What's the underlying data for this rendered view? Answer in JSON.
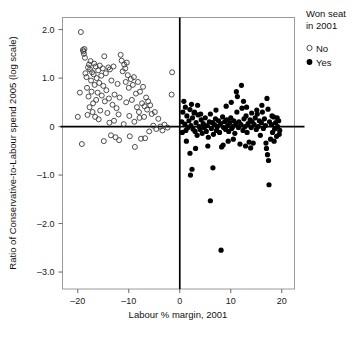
{
  "chart_data": {
    "type": "scatter",
    "title": "",
    "xlabel": "Labour % margin, 2001",
    "ylabel": "Ratio of Conservative-to-Labour spend 2005 (log scale)",
    "xlim": [
      -23,
      22.5
    ],
    "ylim": [
      -3.35,
      2.25
    ],
    "xticks": [
      -20,
      -10,
      0,
      10,
      20
    ],
    "xticklabels": [
      "–20",
      "–10",
      "0",
      "10",
      "20"
    ],
    "yticks": [
      2.0,
      1.0,
      0,
      -1.0,
      -2.0,
      -3.0
    ],
    "yticklabels": [
      "2.0",
      "1.0",
      "0",
      "–1.0",
      "–2.0",
      "–3.0"
    ],
    "grid": false,
    "reference_lines": [
      {
        "orientation": "horizontal",
        "value": 0
      },
      {
        "orientation": "vertical",
        "value": 0
      }
    ],
    "legend": {
      "title": "Won seat\nin 2001",
      "title_line1": "Won seat",
      "title_line2": "in 2001",
      "position": "top-right-outside",
      "entries": [
        {
          "label": "No",
          "marker": "open-circle"
        },
        {
          "label": "Yes",
          "marker": "filled-circle"
        }
      ]
    },
    "series": [
      {
        "name": "No",
        "marker": "open-circle",
        "color": "#3a3a3a",
        "points": [
          [
            -19.4,
            1.95
          ],
          [
            -19.2,
            -0.36
          ],
          [
            -18.9,
            1.55
          ],
          [
            -18.8,
            1.5
          ],
          [
            -18.6,
            1.42
          ],
          [
            -18.5,
            1.1
          ],
          [
            -18.3,
            1.02
          ],
          [
            -18.2,
            0.8
          ],
          [
            -18.0,
            1.22
          ],
          [
            -17.9,
            0.62
          ],
          [
            -17.8,
            1.28
          ],
          [
            -17.6,
            1.18
          ],
          [
            -17.5,
            1.35
          ],
          [
            -17.4,
            0.95
          ],
          [
            -17.3,
            0.72
          ],
          [
            -17.2,
            1.12
          ],
          [
            -17.0,
            0.48
          ],
          [
            -16.9,
            1.08
          ],
          [
            -16.8,
            1.3
          ],
          [
            -16.7,
            0.86
          ],
          [
            -16.5,
            1.24
          ],
          [
            -16.4,
            0.55
          ],
          [
            -16.3,
            1.0
          ],
          [
            -16.1,
            0.7
          ],
          [
            -16.0,
            1.16
          ],
          [
            -15.8,
            0.9
          ],
          [
            -15.7,
            1.26
          ],
          [
            -15.6,
            0.33
          ],
          [
            -15.4,
            1.05
          ],
          [
            -15.3,
            0.64
          ],
          [
            -15.1,
            1.2
          ],
          [
            -15.0,
            0.84
          ],
          [
            -14.8,
            1.45
          ],
          [
            -14.7,
            0.52
          ],
          [
            -14.5,
            1.1
          ],
          [
            -14.4,
            0.75
          ],
          [
            -14.2,
            0.28
          ],
          [
            -14.0,
            1.22
          ],
          [
            -13.9,
            0.58
          ],
          [
            -13.7,
            1.18
          ],
          [
            -13.5,
            -0.18
          ],
          [
            -13.4,
            0.95
          ],
          [
            -13.2,
            0.45
          ],
          [
            -13.0,
            1.24
          ],
          [
            -12.8,
            0.66
          ],
          [
            -12.6,
            -0.22
          ],
          [
            -12.4,
            0.38
          ],
          [
            -12.2,
            0.88
          ],
          [
            -12.0,
            0.25
          ],
          [
            -11.8,
            0.6
          ],
          [
            -11.6,
            1.48
          ],
          [
            -11.4,
            1.36
          ],
          [
            -11.2,
            1.14
          ],
          [
            -11.0,
            0.05
          ],
          [
            -10.9,
            1.28
          ],
          [
            -10.7,
            1.2
          ],
          [
            -10.6,
            0.92
          ],
          [
            -10.4,
            1.32
          ],
          [
            -10.2,
            1.06
          ],
          [
            -10.0,
            0.8
          ],
          [
            -9.8,
            -0.2
          ],
          [
            -9.6,
            0.98
          ],
          [
            -9.4,
            0.55
          ],
          [
            -9.2,
            0.86
          ],
          [
            -9.0,
            1.02
          ],
          [
            -8.8,
            -0.42
          ],
          [
            -8.6,
            0.68
          ],
          [
            -8.4,
            0.4
          ],
          [
            -8.2,
            0.92
          ],
          [
            -8.0,
            0.3
          ],
          [
            -7.8,
            0.72
          ],
          [
            -7.6,
            -0.25
          ],
          [
            -7.4,
            0.48
          ],
          [
            -7.2,
            0.82
          ],
          [
            -7.0,
            0.2
          ],
          [
            -6.8,
            -0.24
          ],
          [
            -6.6,
            0.6
          ],
          [
            -6.4,
            0.35
          ],
          [
            -6.2,
            0.52
          ],
          [
            -6.0,
            -0.1
          ],
          [
            -5.8,
            0.44
          ],
          [
            -5.5,
            0.26
          ],
          [
            -5.2,
            0.02
          ],
          [
            -4.9,
            0.3
          ],
          [
            -4.6,
            -0.05
          ],
          [
            -4.2,
            0.16
          ],
          [
            -3.8,
            0.0
          ],
          [
            -3.4,
            -0.08
          ],
          [
            -3.0,
            0.04
          ],
          [
            -2.4,
            -0.02
          ],
          [
            -1.6,
            0.66
          ],
          [
            -1.5,
            1.12
          ],
          [
            -19.0,
            1.58
          ],
          [
            -18.7,
            1.6
          ],
          [
            -17.7,
            0.4
          ],
          [
            -16.6,
            0.2
          ],
          [
            -15.9,
            0.15
          ],
          [
            -14.9,
            -0.3
          ],
          [
            -13.8,
            0.08
          ],
          [
            -12.9,
            0.12
          ],
          [
            -11.9,
            -0.28
          ],
          [
            -10.5,
            0.5
          ],
          [
            -9.9,
            0.22
          ],
          [
            -8.9,
            0.1
          ],
          [
            -7.9,
            0.18
          ],
          [
            -6.9,
            0.42
          ],
          [
            -20.0,
            0.2
          ],
          [
            -19.6,
            0.7
          ],
          [
            -18.1,
            0.24
          ],
          [
            -17.1,
            0.3
          ]
        ]
      },
      {
        "name": "Yes",
        "marker": "filled-circle",
        "color": "#000000",
        "points": [
          [
            0.4,
            0.1
          ],
          [
            0.5,
            -0.12
          ],
          [
            0.8,
            0.52
          ],
          [
            1.0,
            0.05
          ],
          [
            1.2,
            -0.08
          ],
          [
            1.4,
            0.22
          ],
          [
            1.6,
            -0.02
          ],
          [
            1.8,
            0.12
          ],
          [
            2.0,
            0.35
          ],
          [
            2.0,
            -0.55
          ],
          [
            2.1,
            -1.0
          ],
          [
            2.2,
            0.02
          ],
          [
            2.4,
            -0.88
          ],
          [
            2.5,
            0.18
          ],
          [
            2.6,
            -0.05
          ],
          [
            2.8,
            0.28
          ],
          [
            3.0,
            -0.1
          ],
          [
            3.2,
            0.08
          ],
          [
            3.4,
            -0.18
          ],
          [
            3.6,
            0.24
          ],
          [
            3.8,
            0.0
          ],
          [
            4.0,
            -0.06
          ],
          [
            4.2,
            0.14
          ],
          [
            4.4,
            -0.14
          ],
          [
            4.6,
            0.06
          ],
          [
            4.8,
            -0.02
          ],
          [
            5.0,
            0.18
          ],
          [
            5.2,
            -0.1
          ],
          [
            5.4,
            0.02
          ],
          [
            5.6,
            -0.22
          ],
          [
            5.8,
            0.1
          ],
          [
            6.0,
            -1.53
          ],
          [
            6.0,
            0.26
          ],
          [
            6.2,
            -0.04
          ],
          [
            6.4,
            0.08
          ],
          [
            6.6,
            -0.16
          ],
          [
            6.8,
            0.04
          ],
          [
            7.0,
            0.16
          ],
          [
            7.2,
            -0.08
          ],
          [
            7.4,
            0.0
          ],
          [
            7.6,
            0.12
          ],
          [
            7.8,
            -0.12
          ],
          [
            8.0,
            0.06
          ],
          [
            8.1,
            -2.55
          ],
          [
            8.2,
            -0.42
          ],
          [
            8.4,
            0.2
          ],
          [
            8.6,
            -0.02
          ],
          [
            8.8,
            0.1
          ],
          [
            9.0,
            -0.06
          ],
          [
            9.2,
            0.14
          ],
          [
            9.4,
            0.02
          ],
          [
            9.6,
            -0.1
          ],
          [
            9.8,
            0.08
          ],
          [
            10.0,
            0.18
          ],
          [
            10.2,
            -0.04
          ],
          [
            10.4,
            0.0
          ],
          [
            10.6,
            0.12
          ],
          [
            10.8,
            -0.14
          ],
          [
            11.0,
            0.06
          ],
          [
            11.2,
            0.3
          ],
          [
            11.3,
            0.62
          ],
          [
            11.5,
            -0.02
          ],
          [
            11.6,
            0.1
          ],
          [
            11.8,
            -0.36
          ],
          [
            12.0,
            0.04
          ],
          [
            12.1,
            0.85
          ],
          [
            12.2,
            0.38
          ],
          [
            12.4,
            -0.08
          ],
          [
            12.6,
            0.16
          ],
          [
            12.8,
            0.0
          ],
          [
            13.0,
            0.22
          ],
          [
            13.2,
            -0.12
          ],
          [
            13.4,
            0.06
          ],
          [
            13.6,
            -0.32
          ],
          [
            13.8,
            0.14
          ],
          [
            14.0,
            -0.02
          ],
          [
            14.2,
            0.1
          ],
          [
            14.4,
            -0.34
          ],
          [
            14.6,
            0.04
          ],
          [
            14.8,
            0.18
          ],
          [
            15.0,
            -0.06
          ],
          [
            15.2,
            0.26
          ],
          [
            15.4,
            0.0
          ],
          [
            15.6,
            0.12
          ],
          [
            15.8,
            -0.18
          ],
          [
            16.0,
            0.08
          ],
          [
            16.2,
            0.3
          ],
          [
            16.4,
            -0.04
          ],
          [
            16.6,
            0.16
          ],
          [
            16.8,
            0.02
          ],
          [
            17.0,
            -0.45
          ],
          [
            17.1,
            0.58
          ],
          [
            17.2,
            -0.58
          ],
          [
            17.4,
            -0.7
          ],
          [
            17.5,
            -1.2
          ],
          [
            17.6,
            0.1
          ],
          [
            17.8,
            -0.26
          ],
          [
            18.0,
            0.04
          ],
          [
            18.2,
            -0.12
          ],
          [
            18.4,
            0.2
          ],
          [
            18.6,
            -0.05
          ],
          [
            18.8,
            0.08
          ],
          [
            19.0,
            -0.2
          ],
          [
            19.2,
            0.0
          ],
          [
            19.4,
            0.12
          ],
          [
            19.6,
            -0.08
          ],
          [
            1.1,
            0.4
          ],
          [
            2.9,
            0.3
          ],
          [
            4.1,
            0.26
          ],
          [
            5.5,
            -0.4
          ],
          [
            6.5,
            -0.85
          ],
          [
            7.1,
            0.34
          ],
          [
            9.1,
            0.42
          ],
          [
            10.1,
            0.5
          ],
          [
            11.1,
            0.72
          ],
          [
            12.5,
            0.52
          ],
          [
            13.1,
            0.4
          ],
          [
            14.1,
            0.28
          ],
          [
            15.1,
            0.34
          ],
          [
            16.1,
            0.44
          ],
          [
            17.3,
            0.36
          ],
          [
            18.1,
            0.22
          ],
          [
            19.1,
            0.18
          ],
          [
            3.1,
            -0.45
          ],
          [
            8.5,
            -0.38
          ],
          [
            9.5,
            -0.3
          ],
          [
            10.5,
            -0.26
          ],
          [
            12.9,
            -0.4
          ],
          [
            13.9,
            -0.44
          ],
          [
            16.9,
            -0.34
          ],
          [
            18.5,
            -0.3
          ],
          [
            19.5,
            -0.16
          ],
          [
            2.3,
            0.46
          ],
          [
            0.6,
            0.3
          ],
          [
            1.3,
            -0.3
          ],
          [
            3.5,
            0.44
          ]
        ]
      }
    ]
  }
}
